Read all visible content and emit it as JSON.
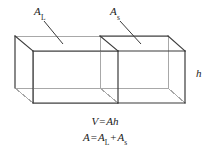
{
  "figure": {
    "type": "geometric-diagram",
    "background_color": "#ffffff",
    "line_color_front": "#3a3a3a",
    "line_color_hidden": "#a8a8a8",
    "labels": {
      "area_large": {
        "base": "A",
        "subscript": "L"
      },
      "area_small": {
        "base": "A",
        "subscript": "s"
      },
      "height": {
        "base": "h",
        "subscript": ""
      }
    },
    "equations": [
      {
        "id": "volume",
        "lhs": "V",
        "operator": "=",
        "rhs_a": "A",
        "rhs_b": "h"
      },
      {
        "id": "area-sum",
        "lhs": "A",
        "operator": "=",
        "term1_base": "A",
        "term1_sub": "L",
        "plus": "+",
        "term2_base": "A",
        "term2_sub": "s"
      }
    ]
  }
}
